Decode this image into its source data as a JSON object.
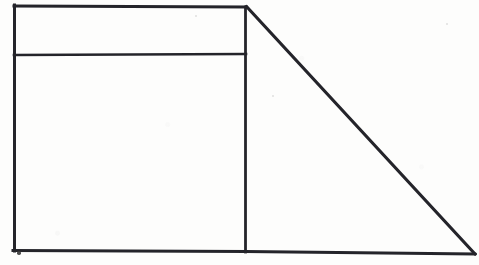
{
  "figure": {
    "background_color": "#fdfdfc",
    "stroke_color": "#24242a",
    "canvas": {
      "width": 479,
      "height": 265
    },
    "shapes": {
      "rectangle": {
        "name": "main-rectangle",
        "top_left": [
          14,
          6
        ],
        "top_right": [
          246,
          7
        ],
        "bottom_right": [
          245,
          251
        ],
        "bottom_left": [
          14,
          250
        ],
        "stroke_width": 3
      },
      "divider": {
        "name": "horizontal-divider-line",
        "start": [
          14,
          55
        ],
        "end": [
          246,
          54
        ],
        "stroke_width": 2.6,
        "note": "splits rectangle into a narrow upper band and a large lower region"
      },
      "triangle": {
        "name": "right-triangle",
        "apex_top": [
          247,
          7
        ],
        "vertex_bottom_right": [
          474,
          253
        ],
        "vertex_bottom_left": [
          245,
          251
        ],
        "stroke_width": 3,
        "note": "vertical leg shared with rectangle right edge; hypotenuse descends left-to-right"
      }
    },
    "regions": [
      {
        "name": "upper-band",
        "label": ""
      },
      {
        "name": "lower-rectangle",
        "label": ""
      },
      {
        "name": "triangle-interior",
        "label": ""
      }
    ],
    "marks": [
      {
        "name": "ink-dot-below-bottom-left",
        "cx": 19,
        "cy": 253,
        "r": 1.7
      },
      {
        "name": "faint-speckle-triangle",
        "cx": 273,
        "cy": 96,
        "r": 1.1
      },
      {
        "name": "faint-speckle-upper-band",
        "cx": 196,
        "cy": 16,
        "r": 1.0
      },
      {
        "name": "faint-speckle-right",
        "cx": 447,
        "cy": 24,
        "r": 1.0
      }
    ]
  }
}
